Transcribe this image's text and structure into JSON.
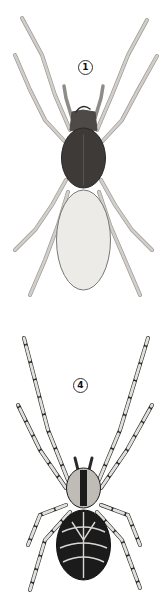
{
  "plate": {
    "figures": [
      {
        "label": "1",
        "subject": "spider-dorsal-view-plain",
        "colors": {
          "cephalothorax": "#3d3a38",
          "abdomen": "#ecebe8",
          "legs": "#c9c6c2",
          "outline": "#4a4745"
        }
      },
      {
        "label": "4",
        "subject": "spider-dorsal-view-banded",
        "colors": {
          "body": "#1c1b1b",
          "pattern": "#d9d7d4",
          "legs": "#e2e0dc",
          "bands": "#151414",
          "outline": "#2a2928"
        }
      }
    ]
  }
}
